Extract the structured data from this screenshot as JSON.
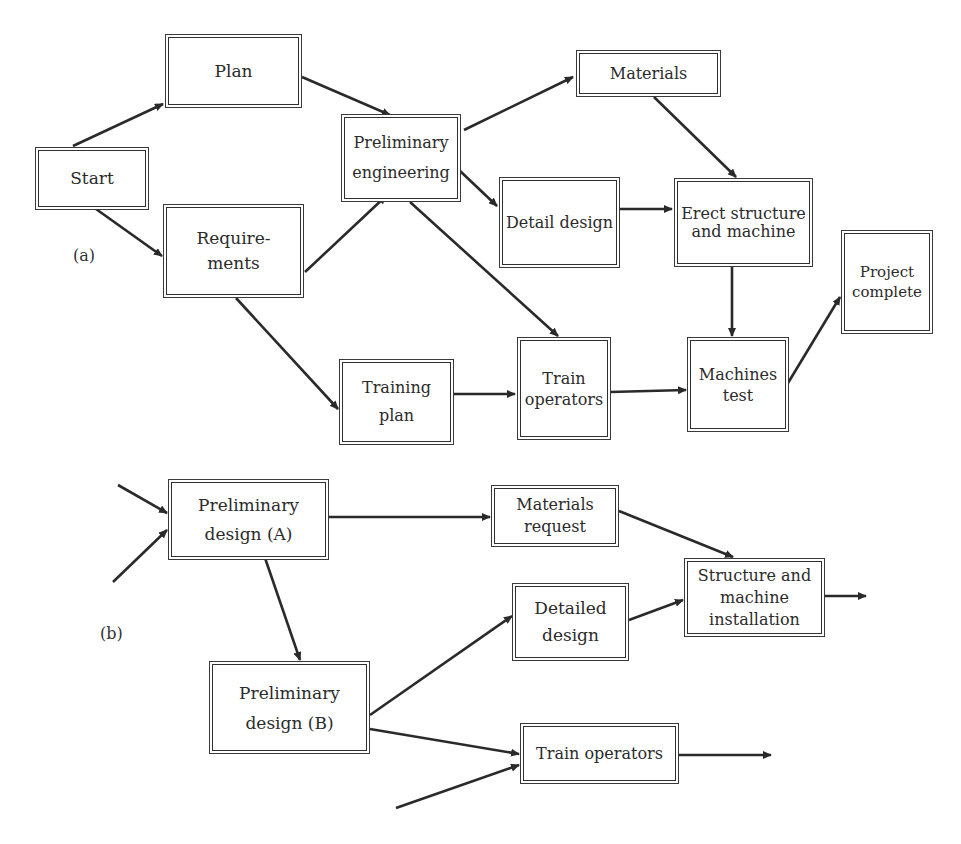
{
  "diagram_a": {
    "label": "(a)",
    "nodes": [
      {
        "id": "start",
        "text": "Start"
      },
      {
        "id": "plan",
        "text": "Plan"
      },
      {
        "id": "requirements",
        "text": "Require-\nments"
      },
      {
        "id": "preliminary_engineering",
        "text": "Preliminary\nengineering"
      },
      {
        "id": "materials",
        "text": "Materials"
      },
      {
        "id": "detail_design",
        "text": "Detail design"
      },
      {
        "id": "erect_structure",
        "text": "Erect structure\nand machine"
      },
      {
        "id": "project_complete",
        "text": "Project\ncomplete"
      },
      {
        "id": "training_plan",
        "text": "Training\nplan"
      },
      {
        "id": "train_operators",
        "text": "Train\noperators"
      },
      {
        "id": "machines_test",
        "text": "Machines\ntest"
      }
    ],
    "edges": [
      [
        "start",
        "plan"
      ],
      [
        "start",
        "requirements"
      ],
      [
        "plan",
        "preliminary_engineering"
      ],
      [
        "requirements",
        "preliminary_engineering"
      ],
      [
        "requirements",
        "training_plan"
      ],
      [
        "preliminary_engineering",
        "materials"
      ],
      [
        "preliminary_engineering",
        "detail_design"
      ],
      [
        "preliminary_engineering",
        "train_operators"
      ],
      [
        "materials",
        "erect_structure"
      ],
      [
        "detail_design",
        "erect_structure"
      ],
      [
        "training_plan",
        "train_operators"
      ],
      [
        "train_operators",
        "machines_test"
      ],
      [
        "erect_structure",
        "machines_test"
      ],
      [
        "machines_test",
        "project_complete"
      ]
    ]
  },
  "diagram_b": {
    "label": "(b)",
    "nodes": [
      {
        "id": "preliminary_design_a",
        "text": "Preliminary\ndesign (A)"
      },
      {
        "id": "materials_request",
        "text": "Materials\nrequest"
      },
      {
        "id": "structure_installation",
        "text": "Structure and\nmachine\ninstallation"
      },
      {
        "id": "detailed_design",
        "text": "Detailed\ndesign"
      },
      {
        "id": "preliminary_design_b",
        "text": "Preliminary\ndesign (B)"
      },
      {
        "id": "train_operators_b",
        "text": "Train operators"
      }
    ],
    "edges": [
      [
        "external",
        "preliminary_design_a"
      ],
      [
        "external",
        "preliminary_design_a"
      ],
      [
        "preliminary_design_a",
        "materials_request"
      ],
      [
        "preliminary_design_a",
        "preliminary_design_b"
      ],
      [
        "materials_request",
        "structure_installation"
      ],
      [
        "detailed_design",
        "structure_installation"
      ],
      [
        "preliminary_design_b",
        "detailed_design"
      ],
      [
        "preliminary_design_b",
        "train_operators_b"
      ],
      [
        "external",
        "train_operators_b"
      ],
      [
        "structure_installation",
        "external"
      ],
      [
        "train_operators_b",
        "external"
      ]
    ]
  }
}
